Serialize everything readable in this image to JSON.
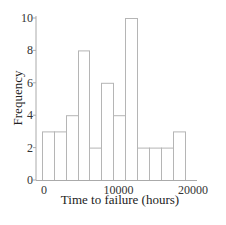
{
  "chart_data": {
    "type": "bar",
    "subtype": "histogram",
    "title": "",
    "xlabel": "Time to failure (hours)",
    "ylabel": "Frequency",
    "xticks": [
      0,
      10000,
      20000
    ],
    "yticks": [
      0,
      2,
      4,
      6,
      8,
      10
    ],
    "ylim": [
      0,
      10
    ],
    "xlim": [
      -1000,
      21000
    ],
    "grid": false,
    "legend": null,
    "bin_width": 1600,
    "bins": [
      {
        "start": -300,
        "end": 1300,
        "count": 3
      },
      {
        "start": 1300,
        "end": 2900,
        "count": 3
      },
      {
        "start": 2900,
        "end": 4500,
        "count": 4
      },
      {
        "start": 4500,
        "end": 6100,
        "count": 8
      },
      {
        "start": 6100,
        "end": 7700,
        "count": 2
      },
      {
        "start": 7700,
        "end": 9300,
        "count": 6
      },
      {
        "start": 9300,
        "end": 10900,
        "count": 4
      },
      {
        "start": 10900,
        "end": 12500,
        "count": 10
      },
      {
        "start": 12500,
        "end": 14100,
        "count": 2
      },
      {
        "start": 14100,
        "end": 15700,
        "count": 2
      },
      {
        "start": 15700,
        "end": 17300,
        "count": 2
      },
      {
        "start": 17300,
        "end": 18900,
        "count": 3
      }
    ],
    "values": [
      3,
      3,
      4,
      8,
      2,
      6,
      4,
      10,
      2,
      2,
      2,
      3
    ],
    "style": {
      "bar_fill": "#ffffff",
      "bar_edge": "#b5b5b5",
      "axis_color": "#aaaaaa"
    }
  },
  "labels": {
    "x_axis_title": "Time to failure (hours)",
    "y_axis_title": "Frequency"
  }
}
